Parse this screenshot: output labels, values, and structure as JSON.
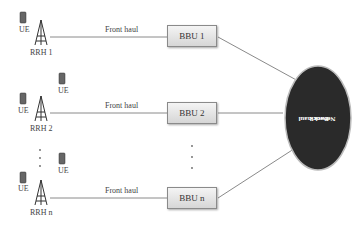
{
  "diagram": {
    "rrh": [
      {
        "label": "RRH 1",
        "ue_labels": [
          "UE"
        ],
        "fronthaul_label": "Front haul",
        "bbu_label": "BBU 1"
      },
      {
        "label": "RRH 2",
        "ue_labels": [
          "UE",
          "UE"
        ],
        "fronthaul_label": "Front haul",
        "bbu_label": "BBU 2"
      },
      {
        "label": "RRH n",
        "ue_labels": [
          "UE",
          "UE"
        ],
        "fronthaul_label": "Front haul",
        "bbu_label": "BBU n"
      }
    ],
    "backhaul": {
      "line1": "Back haul",
      "line2": "Network"
    },
    "ellipsis": "·\n·\n·",
    "colors": {
      "backhaul_fill": "#2a2a2a",
      "line": "#888888",
      "bbu_fill": "#e2e2e2"
    }
  }
}
